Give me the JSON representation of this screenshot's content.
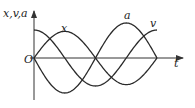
{
  "diagram": {
    "y_axis_label": "x,v,a",
    "x_axis_label": "t",
    "origin_label": "O",
    "curve_labels": {
      "x": "x",
      "v": "v",
      "a": "a"
    }
  },
  "chart_data": {
    "type": "line",
    "title": "",
    "xlabel": "t",
    "ylabel": "x,v,a",
    "x_range_periods": [
      0,
      1
    ],
    "series": [
      {
        "name": "x",
        "function": "A·sin(ωt)",
        "amplitude": 0.95,
        "phase_deg": 0
      },
      {
        "name": "v",
        "function": "Aω·cos(ωt)",
        "amplitude": 1.0,
        "phase_deg": 90
      },
      {
        "name": "a",
        "function": "-Aω²·sin(ωt)",
        "amplitude": 1.25,
        "phase_deg": 180
      }
    ],
    "grid": false,
    "legend": "inline labels"
  }
}
